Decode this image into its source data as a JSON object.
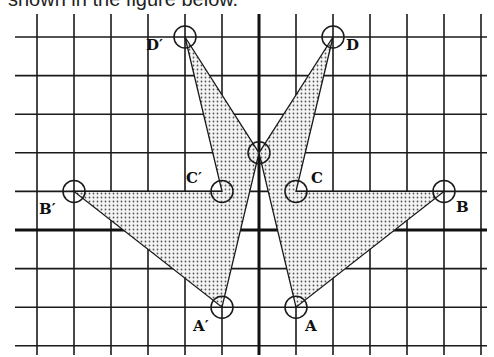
{
  "caption": "shown in the figure below.",
  "grid": {
    "x_min": -6,
    "x_max": 6,
    "y_min": -3,
    "y_max": 5,
    "origin_px": [
      259,
      230
    ],
    "unit_px_x": 37,
    "unit_px_y": 38.6
  },
  "center_point": {
    "x": 0,
    "y": 2
  },
  "shapes": [
    {
      "name": "original",
      "vertices": [
        {
          "label": "",
          "x": 0,
          "y": 2
        },
        {
          "label": "D",
          "x": 2,
          "y": 5
        },
        {
          "label": "C",
          "x": 1,
          "y": 1
        },
        {
          "label": "B",
          "x": 5,
          "y": 1
        },
        {
          "label": "A",
          "x": 1,
          "y": -2
        }
      ]
    },
    {
      "name": "reflection",
      "vertices": [
        {
          "label": "",
          "x": 0,
          "y": 2
        },
        {
          "label": "D′",
          "x": -2,
          "y": 5
        },
        {
          "label": "C′",
          "x": -1,
          "y": 1
        },
        {
          "label": "B′",
          "x": -5,
          "y": 1
        },
        {
          "label": "A′",
          "x": -1,
          "y": -2
        }
      ]
    }
  ],
  "labels": {
    "A": "A",
    "B": "B",
    "C": "C",
    "D": "D",
    "A_prime": "A′",
    "B_prime": "B′",
    "C_prime": "C′",
    "D_prime": "D′"
  },
  "colors": {
    "line": "#1a1a1a",
    "dot": "#555555",
    "background": "#ffffff"
  }
}
